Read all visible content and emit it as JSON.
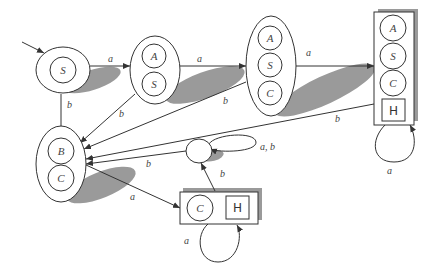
{
  "diagram": {
    "type": "state-transition-automaton",
    "colors": {
      "stroke": "#333333",
      "shadow": "#9a9a9a",
      "background": "#ffffff"
    },
    "states": [
      {
        "id": "S",
        "labels": [
          "S"
        ]
      },
      {
        "id": "AS",
        "labels": [
          "A",
          "S"
        ]
      },
      {
        "id": "ASC",
        "labels": [
          "A",
          "S",
          "C"
        ]
      },
      {
        "id": "ASCH",
        "labels": [
          "A",
          "S",
          "C"
        ],
        "halt": "H"
      },
      {
        "id": "BC",
        "labels": [
          "B",
          "C"
        ]
      },
      {
        "id": "dead",
        "labels": []
      },
      {
        "id": "CH",
        "labels": [
          "C"
        ],
        "halt": "H"
      }
    ],
    "transitions": [
      {
        "from": "start",
        "to": "S",
        "label": ""
      },
      {
        "from": "S",
        "to": "AS",
        "label": "a"
      },
      {
        "from": "S",
        "to": "BC",
        "label": "b"
      },
      {
        "from": "AS",
        "to": "ASC",
        "label": "a"
      },
      {
        "from": "AS",
        "to": "BC",
        "label": "b"
      },
      {
        "from": "ASC",
        "to": "ASCH",
        "label": "a"
      },
      {
        "from": "ASC",
        "to": "BC",
        "label": "b"
      },
      {
        "from": "ASCH",
        "to": "BC",
        "label": "b"
      },
      {
        "from": "ASCH",
        "to": "ASCH",
        "label": "a"
      },
      {
        "from": "BC",
        "to": "CH",
        "label": "a"
      },
      {
        "from": "dead",
        "to": "BC",
        "label": "b"
      },
      {
        "from": "dead",
        "to": "dead",
        "label": "a, b"
      },
      {
        "from": "CH",
        "to": "dead",
        "label": "b"
      },
      {
        "from": "CH",
        "to": "CH",
        "label": "a"
      }
    ],
    "edge_labels": {
      "s_to_as": "a",
      "s_to_bc": "b",
      "as_to_asc": "a",
      "as_to_bc": "b",
      "asc_to_asch": "a",
      "asc_to_bc": "b",
      "asch_to_bc": "b",
      "asch_loop": "a",
      "bc_to_ch": "a",
      "dead_to_bc": "b",
      "dead_loop": "a, b",
      "ch_to_dead": "b",
      "ch_loop": "a"
    },
    "node_labels": {
      "s_inner": "S",
      "as_a": "A",
      "as_s": "S",
      "asc_a": "A",
      "asc_s": "S",
      "asc_c": "C",
      "asch_a": "A",
      "asch_s": "S",
      "asch_c": "C",
      "asch_h": "H",
      "bc_b": "B",
      "bc_c": "C",
      "ch_c": "C",
      "ch_h": "H"
    }
  }
}
